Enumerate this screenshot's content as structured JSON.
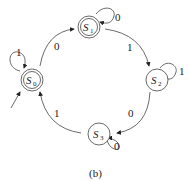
{
  "diagram": {
    "type": "state-machine",
    "caption": "(b)",
    "states": [
      {
        "id": "S0",
        "name": "S",
        "sub": "0",
        "accepting": true,
        "initial": true
      },
      {
        "id": "S1",
        "name": "S",
        "sub": "1",
        "accepting": true,
        "initial": false
      },
      {
        "id": "S2",
        "name": "S",
        "sub": "2",
        "accepting": false,
        "initial": false
      },
      {
        "id": "S3",
        "name": "S",
        "sub": "3",
        "accepting": false,
        "initial": false
      }
    ],
    "transitions": [
      {
        "from": "S0",
        "to": "S0",
        "label": "1"
      },
      {
        "from": "S0",
        "to": "S1",
        "label": "0"
      },
      {
        "from": "S1",
        "to": "S1",
        "label": "0"
      },
      {
        "from": "S1",
        "to": "S2",
        "label": "1"
      },
      {
        "from": "S2",
        "to": "S2",
        "label": "1"
      },
      {
        "from": "S2",
        "to": "S3",
        "label": "0"
      },
      {
        "from": "S3",
        "to": "S3",
        "label": "0"
      },
      {
        "from": "S3",
        "to": "S0",
        "label": "1"
      }
    ]
  }
}
